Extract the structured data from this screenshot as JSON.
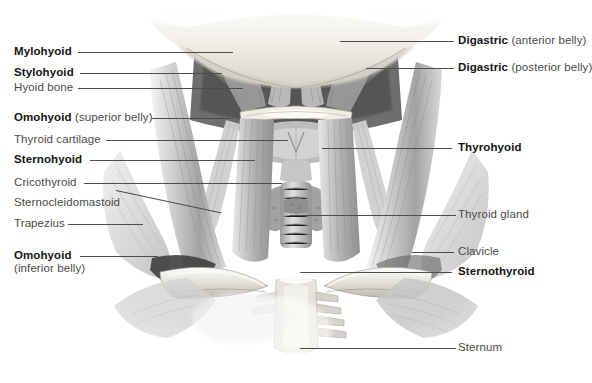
{
  "figure": {
    "background_color": "#ffffff",
    "label_color": "#4a4a4a",
    "label_bold_color": "#141414",
    "leader_color": "#4d4d4d"
  },
  "labels_left": [
    {
      "id": "mylohyoid",
      "bold": "Mylohyoid",
      "rest": "",
      "sub": ""
    },
    {
      "id": "stylohyoid",
      "bold": "Stylohyoid",
      "rest": "",
      "sub": ""
    },
    {
      "id": "hyoid-bone",
      "bold": "",
      "rest": "Hyoid bone",
      "sub": ""
    },
    {
      "id": "omohyoid-superior",
      "bold": "Omohyoid",
      "rest": " (superior belly)",
      "sub": ""
    },
    {
      "id": "thyroid-cartilage",
      "bold": "",
      "rest": "Thyroid cartilage",
      "sub": ""
    },
    {
      "id": "sternohyoid",
      "bold": "Sternohyoid",
      "rest": "",
      "sub": ""
    },
    {
      "id": "cricothyroid",
      "bold": "",
      "rest": "Cricothyroid",
      "sub": ""
    },
    {
      "id": "sternocleidomastoid",
      "bold": "",
      "rest": "Sternocleidomastoid",
      "sub": ""
    },
    {
      "id": "trapezius",
      "bold": "",
      "rest": "Trapezius",
      "sub": ""
    },
    {
      "id": "omohyoid-inferior",
      "bold": "Omohyoid",
      "rest": "",
      "sub": "(inferior belly)"
    }
  ],
  "labels_right": [
    {
      "id": "digastric-anterior",
      "bold": "Digastric",
      "rest": " (anterior belly)"
    },
    {
      "id": "digastric-posterior",
      "bold": "Digastric",
      "rest": " (posterior belly)"
    },
    {
      "id": "thyrohyoid",
      "bold": "Thyrohyoid",
      "rest": ""
    },
    {
      "id": "thyroid-gland",
      "bold": "",
      "rest": "Thyroid gland"
    },
    {
      "id": "clavicle",
      "bold": "",
      "rest": "Clavicle"
    },
    {
      "id": "sternothyroid",
      "bold": "Sternothyroid",
      "rest": ""
    },
    {
      "id": "sternum",
      "bold": "",
      "rest": "Sternum"
    }
  ]
}
